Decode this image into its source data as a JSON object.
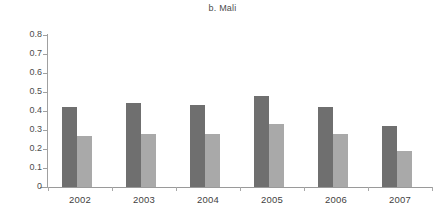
{
  "chart_data": {
    "type": "bar",
    "title": "b. Mali",
    "xlabel": "",
    "ylabel": "",
    "categories": [
      "2002",
      "2003",
      "2004",
      "2005",
      "2006",
      "2007"
    ],
    "series": [
      {
        "name": "series-1",
        "color": "#6f6f6f",
        "values": [
          0.42,
          0.44,
          0.43,
          0.48,
          0.42,
          0.32
        ]
      },
      {
        "name": "series-2",
        "color": "#a9a9a9",
        "values": [
          0.27,
          0.28,
          0.28,
          0.33,
          0.28,
          0.19
        ]
      }
    ],
    "ylim": [
      0,
      0.8
    ],
    "ytick_values": [
      0,
      0.1,
      0.2,
      0.3,
      0.4,
      0.5,
      0.6,
      0.7,
      0.8
    ],
    "ytick_labels": [
      "0",
      "0.1",
      "0.2",
      "0.3",
      "0.4",
      "0.5",
      "0.6",
      "0.7",
      "0.8"
    ],
    "grid": false,
    "legend": "none"
  }
}
